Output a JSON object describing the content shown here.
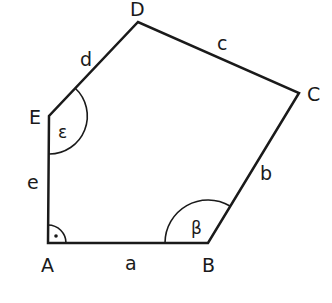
{
  "figure": {
    "type": "pentagon",
    "colors": {
      "stroke": "#1a1a1a",
      "background": "#ffffff"
    },
    "vertices": [
      {
        "label": "A",
        "x": 48,
        "y": 243
      },
      {
        "label": "B",
        "x": 208,
        "y": 243
      },
      {
        "label": "C",
        "x": 299,
        "y": 93
      },
      {
        "label": "D",
        "x": 138,
        "y": 22
      },
      {
        "label": "E",
        "x": 49,
        "y": 116
      }
    ],
    "sides": [
      {
        "label": "a",
        "from": "A",
        "to": "B"
      },
      {
        "label": "b",
        "from": "B",
        "to": "C"
      },
      {
        "label": "c",
        "from": "C",
        "to": "D"
      },
      {
        "label": "d",
        "from": "D",
        "to": "E"
      },
      {
        "label": "e",
        "from": "E",
        "to": "A"
      }
    ],
    "angles": [
      {
        "vertex": "A",
        "label": "",
        "marker": "right-angle-dot"
      },
      {
        "vertex": "B",
        "label": "β"
      },
      {
        "vertex": "E",
        "label": "ε"
      }
    ]
  }
}
